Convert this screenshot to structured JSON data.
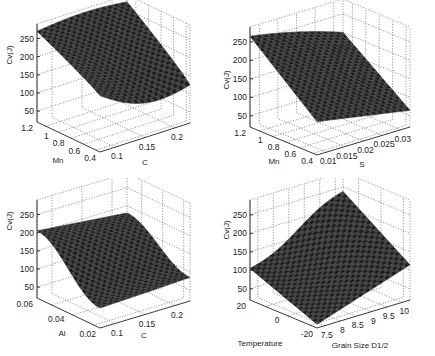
{
  "chart_data": [
    {
      "type": "surface",
      "position": "top-left",
      "title": "",
      "zlabel": "Cv(J)",
      "xlabel": "C",
      "ylabel": "Mn",
      "x_ticks": [
        "0.1",
        "0.15",
        "0.2"
      ],
      "y_ticks": [
        "1.2",
        "1",
        "0.8",
        "0.6",
        "0.4"
      ],
      "z_ticks": [
        "50",
        "100",
        "150",
        "200",
        "250"
      ],
      "xlim": [
        0.08,
        0.2
      ],
      "ylim": [
        0.4,
        1.2
      ],
      "zlim": [
        20,
        290
      ],
      "grid": true,
      "corner_values": {
        "Mn1.2_C0.08": 275,
        "Mn1.2_C0.2": 280,
        "Mn0.4_C0.08": 175,
        "Mn0.4_C0.2": 120
      },
      "description": "Cv decreases with increasing C and decreasing Mn; min ~100 J near C=0.17, Mn=0.4"
    },
    {
      "type": "surface",
      "position": "top-right",
      "title": "",
      "zlabel": "Cv(J)",
      "xlabel": "S",
      "ylabel": "Mn",
      "x_ticks": [
        "0.01",
        "0.015",
        "0.02",
        "0.025",
        "0.03"
      ],
      "y_ticks": [
        "1.2",
        "1",
        "0.8",
        "0.6",
        "0.4"
      ],
      "z_ticks": [
        "50",
        "100",
        "150",
        "200",
        "250"
      ],
      "xlim": [
        0.005,
        0.03
      ],
      "ylim": [
        0.4,
        1.2
      ],
      "zlim": [
        20,
        290
      ],
      "grid": true,
      "corner_values": {
        "Mn1.2_S0.005": 265,
        "Mn1.2_S0.03": 200,
        "Mn0.4_S0.005": 110,
        "Mn0.4_S0.03": 70
      },
      "description": "Cv decreases with increasing S and decreasing Mn"
    },
    {
      "type": "surface",
      "position": "bottom-left",
      "title": "",
      "zlabel": "Cv(J)",
      "xlabel": "C",
      "ylabel": "Al",
      "x_ticks": [
        "0.1",
        "0.15",
        "0.2"
      ],
      "y_ticks": [
        "0.06",
        "0.04",
        "0.02"
      ],
      "z_ticks": [
        "50",
        "100",
        "150",
        "200",
        "250"
      ],
      "xlim": [
        0.08,
        0.2
      ],
      "ylim": [
        0.01,
        0.06
      ],
      "zlim": [
        20,
        290
      ],
      "grid": true,
      "corner_values": {
        "Al0.06_C0.08": 205,
        "Al0.06_C0.2": 185,
        "Al0.01_C0.08": 70,
        "Al0.01_C0.2": 80
      },
      "description": "Cv highest (~205 J) at high Al; drops toward low Al"
    },
    {
      "type": "surface",
      "position": "bottom-right",
      "title": "",
      "zlabel": "Cv(J)",
      "xlabel": "Grain Size D1/2",
      "ylabel": "Temperature",
      "x_ticks": [
        "7.5",
        "8",
        "8.5",
        "9",
        "9.5",
        "10"
      ],
      "y_ticks": [
        "20",
        "0",
        "-20"
      ],
      "z_ticks": [
        "50",
        "100",
        "150",
        "200",
        "250"
      ],
      "xlim": [
        7.5,
        10
      ],
      "ylim": [
        -20,
        20
      ],
      "zlim": [
        20,
        290
      ],
      "grid": true,
      "corner_values": {
        "T20_G7.5": 105,
        "T20_G10": 245,
        "T-20_G7.5": 30,
        "T-20_G10": 110
      },
      "description": "Cv increases with temperature and grain size D^1/2"
    }
  ]
}
